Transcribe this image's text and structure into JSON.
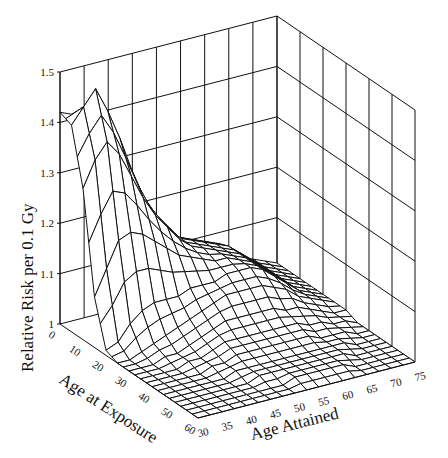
{
  "chart_data": {
    "type": "surface3d",
    "title": "",
    "zlabel": "Relative Risk per 0.1 Gy",
    "xlabel": "Age at Exposure",
    "ylabel": "Age Attained",
    "z_ticks": [
      "1",
      "1.1",
      "1.2",
      "1.3",
      "1.4",
      "1.5"
    ],
    "zlim": [
      1,
      1.5
    ],
    "x_ticks": [
      "0",
      "10",
      "20",
      "30",
      "40",
      "50",
      "60"
    ],
    "xlim": [
      0,
      60
    ],
    "y_ticks": [
      "30",
      "35",
      "40",
      "45",
      "50",
      "55",
      "60",
      "65",
      "70",
      "75"
    ],
    "ylim": [
      30,
      75
    ],
    "grid": true,
    "x_values": [
      0,
      5,
      10,
      15,
      20,
      25,
      30,
      35,
      40,
      45,
      50,
      55,
      60
    ],
    "y_values": [
      30,
      32.5,
      35,
      37.5,
      40,
      42.5,
      45,
      47.5,
      50,
      52.5,
      55,
      57.5,
      60,
      62.5,
      65,
      67.5,
      70,
      72.5,
      75
    ],
    "z_values": [
      [
        1.42,
        1.41,
        1.4,
        1.38,
        1.33,
        1.27,
        1.21,
        1.17,
        1.14,
        1.12,
        1.11,
        1.1,
        1.09,
        1.08,
        1.06,
        1.04,
        1.03,
        1.02,
        1.01
      ],
      [
        1.41,
        1.44,
        1.47,
        1.42,
        1.36,
        1.29,
        1.23,
        1.19,
        1.16,
        1.13,
        1.12,
        1.11,
        1.1,
        1.09,
        1.07,
        1.05,
        1.03,
        1.02,
        1.01
      ],
      [
        1.3,
        1.35,
        1.38,
        1.35,
        1.3,
        1.25,
        1.21,
        1.18,
        1.15,
        1.13,
        1.12,
        1.11,
        1.1,
        1.09,
        1.07,
        1.05,
        1.03,
        1.02,
        1.01
      ],
      [
        1.1,
        1.15,
        1.2,
        1.21,
        1.2,
        1.18,
        1.16,
        1.14,
        1.13,
        1.12,
        1.11,
        1.11,
        1.1,
        1.09,
        1.07,
        1.05,
        1.03,
        1.02,
        1.01
      ],
      [
        1.01,
        1.02,
        1.05,
        1.07,
        1.08,
        1.08,
        1.08,
        1.09,
        1.09,
        1.09,
        1.1,
        1.1,
        1.1,
        1.09,
        1.07,
        1.05,
        1.03,
        1.02,
        1.01
      ],
      [
        1.0,
        1.0,
        1.01,
        1.02,
        1.03,
        1.04,
        1.05,
        1.06,
        1.07,
        1.08,
        1.08,
        1.08,
        1.08,
        1.07,
        1.06,
        1.04,
        1.03,
        1.02,
        1.01
      ],
      [
        1.0,
        1.0,
        1.0,
        1.01,
        1.01,
        1.02,
        1.03,
        1.04,
        1.05,
        1.05,
        1.05,
        1.05,
        1.05,
        1.04,
        1.04,
        1.03,
        1.02,
        1.01,
        1.01
      ],
      [
        1.0,
        1.0,
        1.0,
        1.0,
        1.01,
        1.01,
        1.02,
        1.03,
        1.03,
        1.03,
        1.03,
        1.03,
        1.03,
        1.03,
        1.02,
        1.02,
        1.01,
        1.01,
        1.0
      ],
      [
        1.0,
        1.0,
        1.0,
        1.0,
        1.0,
        1.01,
        1.01,
        1.02,
        1.02,
        1.02,
        1.02,
        1.02,
        1.02,
        1.02,
        1.01,
        1.01,
        1.01,
        1.0,
        1.0
      ],
      [
        1.0,
        1.0,
        1.0,
        1.0,
        1.0,
        1.0,
        1.01,
        1.01,
        1.01,
        1.01,
        1.01,
        1.01,
        1.01,
        1.01,
        1.01,
        1.01,
        1.0,
        1.0,
        1.0
      ],
      [
        1.0,
        1.0,
        1.0,
        1.0,
        1.0,
        1.0,
        1.0,
        1.01,
        1.01,
        1.01,
        1.01,
        1.01,
        1.01,
        1.01,
        1.01,
        1.0,
        1.0,
        1.0,
        1.0
      ],
      [
        1.0,
        1.0,
        1.0,
        1.0,
        1.0,
        1.0,
        1.0,
        1.0,
        1.0,
        1.01,
        1.01,
        1.01,
        1.01,
        1.01,
        1.0,
        1.0,
        1.0,
        1.0,
        1.0
      ],
      [
        1.0,
        1.0,
        1.0,
        1.0,
        1.0,
        1.0,
        1.0,
        1.0,
        1.0,
        1.0,
        1.0,
        1.0,
        1.0,
        1.0,
        1.0,
        1.0,
        1.0,
        1.0,
        1.0
      ]
    ]
  },
  "axis_titles": {
    "z": "Relative Risk per 0.1 Gy",
    "x": "Age at Exposure",
    "y": "Age Attained"
  }
}
